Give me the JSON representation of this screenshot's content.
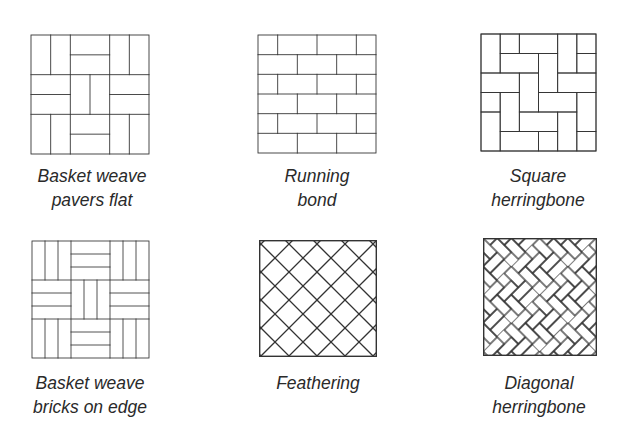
{
  "stroke_color": "#333333",
  "patterns": [
    {
      "id": "basket-weave-flat",
      "caption": [
        "Basket weave",
        "pavers flat"
      ]
    },
    {
      "id": "running-bond",
      "caption": [
        "Running",
        "bond"
      ]
    },
    {
      "id": "square-herringbone",
      "caption": [
        "Square",
        "herringbone"
      ]
    },
    {
      "id": "basket-weave-edge",
      "caption": [
        "Basket weave",
        "bricks on edge"
      ]
    },
    {
      "id": "feathering",
      "caption": [
        "Feathering"
      ]
    },
    {
      "id": "diagonal-herringbone",
      "caption": [
        "Diagonal",
        "herringbone"
      ]
    }
  ]
}
